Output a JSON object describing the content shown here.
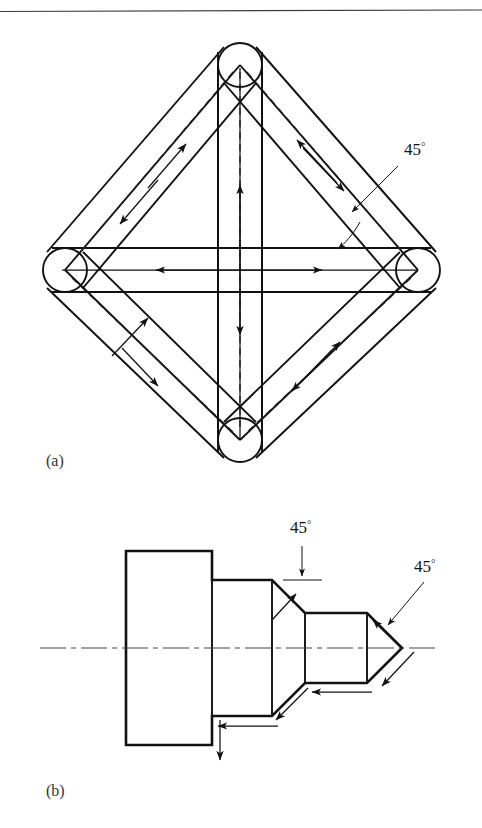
{
  "page": {
    "width": 482,
    "height": 828,
    "background": "#ffffff",
    "ink": "#111111",
    "top_rule": {
      "present": true,
      "y": 11,
      "x1": 0,
      "x2": 482
    }
  },
  "figure": {
    "kind": "engineering-diagram",
    "panels": [
      {
        "id": "a",
        "caption": "(a)",
        "caption_pos": {
          "x": 46,
          "y": 466
        },
        "description": "Diamond (rhombic) frame of four round-ended bars joined at four circular nodes, with a horizontal and a vertical bar crossing through the centre. Dashed centre lines carry double-headed direction arrows.",
        "nodes": [
          {
            "name": "top",
            "cx": 240,
            "cy": 65,
            "r": 22
          },
          {
            "name": "left",
            "cx": 65,
            "cy": 270,
            "r": 22
          },
          {
            "name": "right",
            "cx": 418,
            "cy": 270,
            "r": 22
          },
          {
            "name": "bottom",
            "cx": 240,
            "cy": 440,
            "r": 22
          }
        ],
        "angle_labels": [
          {
            "text": "45",
            "degree_symbol": "°",
            "x": 404,
            "y": 155
          }
        ]
      },
      {
        "id": "b",
        "caption": "(b)",
        "caption_pos": {
          "x": 46,
          "y": 796
        },
        "description": "Side view of a stepped, chamfered shaft: large cylinder, medium cylinder, 45-degree shoulder taper, small cylinder, and a 45-degree conical point. Tool-path arrows run along each machined face; a dash-dot axis runs through the centre.",
        "axis": {
          "y": 648,
          "x1": 40,
          "x2": 438
        },
        "angle_labels": [
          {
            "text": "45",
            "degree_symbol": "°",
            "x": 300,
            "y": 533
          },
          {
            "text": "45",
            "degree_symbol": "°",
            "x": 420,
            "y": 572
          }
        ]
      }
    ]
  },
  "geometry_a": {
    "bar_half_width": 22,
    "inner_frame": "rhombus through node centres",
    "cross_bars": [
      {
        "name": "horizontal-bar",
        "from": "left",
        "to": "right",
        "half_width": 22
      },
      {
        "name": "vertical-bar",
        "from": "top",
        "to": "bottom",
        "half_width": 22
      }
    ],
    "arrow_pairs": [
      {
        "on": "upper-left-bar",
        "dirs": [
          "up-right",
          "down-left"
        ]
      },
      {
        "on": "upper-right-bar",
        "dirs": [
          "up-left",
          "down-right"
        ]
      },
      {
        "on": "lower-left-bar",
        "dirs": [
          "up-right",
          "down-left"
        ]
      },
      {
        "on": "lower-right-bar",
        "dirs": [
          "up-right",
          "down-left"
        ]
      },
      {
        "on": "horizontal-bar",
        "dirs": [
          "left",
          "right"
        ]
      },
      {
        "on": "vertical-bar",
        "dirs": [
          "up",
          "down"
        ]
      }
    ]
  },
  "geometry_b": {
    "steps": [
      {
        "name": "large-cylinder",
        "x1": 126,
        "x2": 212,
        "half_height": 97
      },
      {
        "name": "medium-cylinder",
        "x1": 212,
        "x2": 272,
        "half_height": 68
      },
      {
        "name": "shoulder-taper",
        "x1": 272,
        "x2": 305,
        "angle": 45
      },
      {
        "name": "small-cylinder",
        "x1": 305,
        "x2": 367,
        "half_height": 35
      },
      {
        "name": "conical-point",
        "x1": 367,
        "x2": 402,
        "angle": 45
      }
    ],
    "tool_arrows": [
      {
        "name": "tip-cone-arrow",
        "dir": "up-left along cone"
      },
      {
        "name": "lower-cone-arrow",
        "dir": "down-right along cone"
      },
      {
        "name": "small-cyl-arrow",
        "dir": "left along small cylinder"
      },
      {
        "name": "lower-taper-arrow",
        "dir": "down-left along taper"
      },
      {
        "name": "medium-cyl-arrow",
        "dir": "left along medium cylinder"
      },
      {
        "name": "shoulder-face-arrow",
        "dir": "down along shoulder face"
      },
      {
        "name": "upper-taper-arrow",
        "dir": "up-right along taper"
      }
    ]
  }
}
